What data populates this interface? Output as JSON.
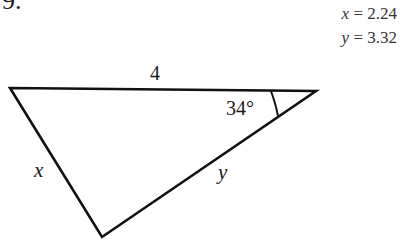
{
  "problem": {
    "number": "9.",
    "answers": [
      {
        "var": "x",
        "eq": " = 2.24"
      },
      {
        "var": "y",
        "eq": " = 3.32"
      }
    ]
  },
  "triangle": {
    "side_top": "4",
    "angle": "34°",
    "side_left": "x",
    "side_right": "y"
  }
}
